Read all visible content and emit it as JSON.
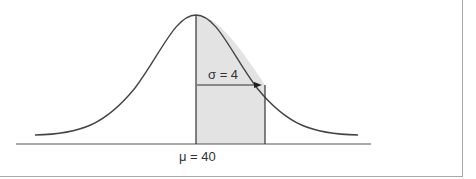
{
  "diagram": {
    "type": "normal-distribution",
    "mean_label": "μ = 40",
    "sigma_label": "σ = 4",
    "mean": 40,
    "sigma": 4,
    "shaded_region": "mean to mean + 1σ",
    "colors": {
      "curve": "#444444",
      "shade": "#e3e3e3",
      "axis": "#555555",
      "frame": "#a8a8a8"
    }
  }
}
